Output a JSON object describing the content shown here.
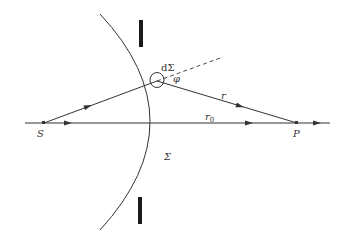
{
  "diagram": {
    "type": "huygens-fresnel-spherical-wavefront",
    "labels": {
      "source": "S",
      "observation_point": "P",
      "wavefront": "Σ",
      "surface_element": "dΣ",
      "angle": "φ",
      "distance": "r",
      "distance_axis": "r",
      "distance_axis_subscript": "0"
    },
    "colors": {
      "line": "#333333",
      "aperture": "#1a1a1a",
      "background": "#ffffff"
    }
  }
}
